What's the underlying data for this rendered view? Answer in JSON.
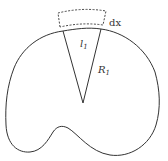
{
  "figure": {
    "labels": {
      "element_width": "dx",
      "arc_length": {
        "base": "l",
        "subscript": "1"
      },
      "radius": {
        "base": "R",
        "subscript": "1"
      }
    },
    "colors": {
      "stroke": "#333333",
      "background": "#ffffff"
    }
  }
}
